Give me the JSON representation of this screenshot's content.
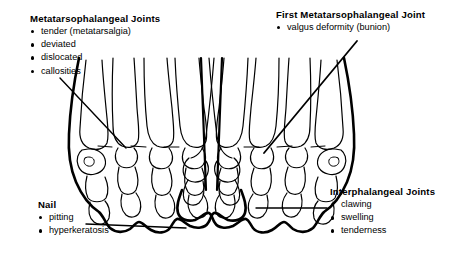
{
  "figure": {
    "type": "medical-anatomical-diagram",
    "background_color": "#ffffff",
    "line_color": "#000000"
  },
  "labels": [
    {
      "id": "metatarsophalangeal-joints",
      "title": "Metatarsophalangeal Joints",
      "items": [
        "tender (metatarsalgia)",
        "deviated",
        "dislocated",
        "callosities"
      ]
    },
    {
      "id": "first-metatarsophalangeal-joint",
      "title": "First Metatarsophalangeal Joint",
      "items": [
        "valgus deformity (bunion)"
      ]
    },
    {
      "id": "nail",
      "title": "Nail",
      "items": [
        "pitting",
        "hyperkeratosis"
      ]
    },
    {
      "id": "interphalangeal-joints",
      "title": "Interphalangeal Joints",
      "items": [
        "clawing",
        "swelling",
        "tenderness"
      ]
    }
  ],
  "leader_lines": [
    {
      "id": "mtp-leader",
      "from": [
        60,
        78
      ],
      "to": [
        126,
        148
      ]
    },
    {
      "id": "bunion-leader",
      "from": [
        357,
        41
      ],
      "to": [
        264,
        153
      ]
    },
    {
      "id": "nail-leader",
      "from": [
        86,
        224
      ],
      "to": [
        186,
        228
      ]
    },
    {
      "id": "ip-leader",
      "from": [
        256,
        208
      ],
      "to": [
        327,
        208
      ]
    }
  ],
  "feet": [
    {
      "id": "left-foot",
      "great_toe_side": "left",
      "region": [
        60,
        55,
        175,
        199
      ]
    },
    {
      "id": "right-foot",
      "great_toe_side": "right",
      "region": [
        228,
        55,
        135,
        199
      ]
    }
  ]
}
